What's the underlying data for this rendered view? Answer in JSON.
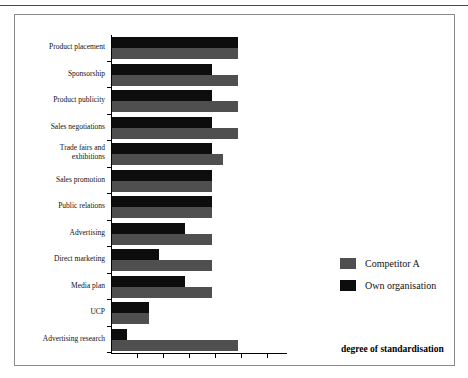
{
  "chart_data": {
    "type": "bar",
    "orientation": "horizontal",
    "title": "",
    "xlabel": "degree of standardisation",
    "ylabel": "",
    "grid": false,
    "legend_position": "right",
    "xlim": [
      0,
      100
    ],
    "x_tick_labels": [],
    "categories": [
      "Product placement",
      "Sponsorship",
      "Product publicity",
      "Sales negotiations",
      "Trade fairs and exhibitions",
      "Sales promotion",
      "Public relations",
      "Advertising",
      "Direct marketing",
      "Media plan",
      "UCP",
      "Advertising research"
    ],
    "series": [
      {
        "name": "Own organisation",
        "color": "#0d0d0d",
        "values": [
          100,
          79,
          79,
          79,
          79,
          79,
          79,
          58,
          37,
          58,
          29,
          12
        ]
      },
      {
        "name": "Competitor A",
        "color": "#4f4f4f",
        "values": [
          100,
          100,
          100,
          100,
          88,
          79,
          79,
          79,
          79,
          79,
          29,
          100
        ]
      }
    ]
  },
  "legend": {
    "items": [
      {
        "label": "Competitor A",
        "swatch": "competitor-a-swatch"
      },
      {
        "label": "Own organisation",
        "swatch": "own-organisation-swatch"
      }
    ]
  },
  "axis": {
    "caption": "degree of standardisation"
  }
}
